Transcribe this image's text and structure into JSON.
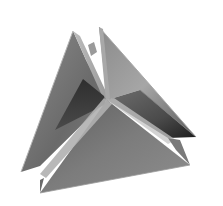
{
  "image": {
    "subject": "Interlocking triangular plates (3D geometric sculpture)",
    "background": "#ffffff",
    "palette": {
      "light": "#c8c8c8",
      "mid": "#8a8a8a",
      "dark": "#3a3a3a",
      "darkest": "#1e1e1e",
      "edge_highlight": "#d8d8d8"
    }
  }
}
